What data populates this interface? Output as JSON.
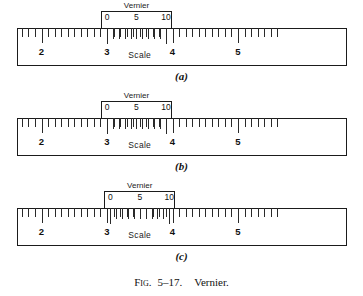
{
  "figure": {
    "caption_prefix": "Fig.",
    "caption_number": "5–17.",
    "caption_title": "Vernier."
  },
  "scale": {
    "word": "Scale",
    "labels": [
      "2",
      "3",
      "4",
      "5"
    ],
    "label_values": [
      2,
      3,
      4,
      5
    ],
    "minor_ticks_per_unit": 10,
    "unit_span_px": 65.5,
    "origin_x_px": 41.5,
    "ruler_left_px": 17,
    "ruler_right_px": 347,
    "range_start": 1.65,
    "range_end": 5.65
  },
  "vernier": {
    "word": "Vernier",
    "labels": [
      "0",
      "5",
      "10"
    ],
    "label_values": [
      0,
      5,
      10
    ],
    "divisions": 10,
    "tick_count": 11,
    "span_units": 0.9
  },
  "panels": [
    {
      "letter": "(a)",
      "top_px": 0,
      "vernier_zero_value": 3.0,
      "reading": "3.00"
    },
    {
      "letter": "(b)",
      "top_px": 90,
      "vernier_zero_value": 3.0,
      "reading": "3.00"
    },
    {
      "letter": "(c)",
      "top_px": 180,
      "vernier_zero_value": 3.05,
      "reading": "3.05"
    }
  ],
  "colors": {
    "ink": "#1b1b1b",
    "tick": "#2a2a2a",
    "background": "#ffffff"
  }
}
